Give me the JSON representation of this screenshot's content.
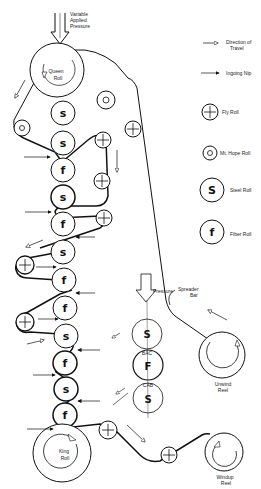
{
  "diagram": {
    "type": "supercalender roll stack schematic",
    "top_label": [
      "Variable",
      "Applied",
      "Pressure"
    ],
    "legend": [
      {
        "symbol": "hollow-arrow",
        "label": [
          "Direction of",
          "Travel"
        ]
      },
      {
        "symbol": "solid-arrow",
        "label": [
          "Ingoing Nip"
        ]
      },
      {
        "symbol": "fly-roll",
        "glyph": "+",
        "label": [
          "Fly Roll"
        ]
      },
      {
        "symbol": "mt-hope-roll",
        "glyph": "o",
        "label": [
          "Mt. Hope Roll"
        ]
      },
      {
        "symbol": "steel-roll",
        "glyph": "S",
        "label": [
          "Steel Roll"
        ]
      },
      {
        "symbol": "fiber-roll",
        "glyph": "f",
        "label": [
          "Fiber Roll"
        ]
      }
    ],
    "main_stack": {
      "top_roll": [
        "Queen",
        "Roll"
      ],
      "rolls": [
        "s",
        "s",
        "f",
        "s",
        "f",
        "s",
        "f",
        "f",
        "s",
        "f",
        "s",
        "f"
      ],
      "bottom_roll": [
        "King",
        "Roll"
      ]
    },
    "inset_stack": {
      "pressure_label": "Pressure",
      "rolls": [
        "S",
        "F",
        "S"
      ],
      "nip_labels": [
        "BAC",
        "CAB"
      ]
    },
    "spreader_label": [
      "Spreader",
      "Bar"
    ],
    "unwind_label": [
      "Unwind",
      "Reel"
    ],
    "windup_label": [
      "Windup",
      "Reel"
    ]
  }
}
